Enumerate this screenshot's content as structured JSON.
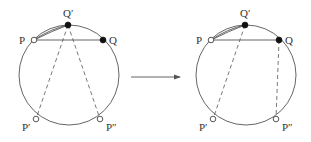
{
  "diagram": {
    "left": {
      "labels": {
        "P": "P",
        "Q_prime": "Q′",
        "Q": "Q",
        "P_prime": "P′",
        "P_double_prime": "P″"
      },
      "points": [
        {
          "name": "P",
          "style": "open"
        },
        {
          "name": "Q′",
          "style": "filled"
        },
        {
          "name": "Q",
          "style": "filled"
        },
        {
          "name": "P′",
          "style": "open"
        },
        {
          "name": "P″",
          "style": "open"
        }
      ],
      "solid_segments": [
        [
          "P",
          "Q"
        ],
        [
          "P",
          "Q′"
        ]
      ],
      "dashed_segments": [
        [
          "Q′",
          "P′"
        ],
        [
          "Q′",
          "P″"
        ]
      ]
    },
    "right": {
      "labels": {
        "P": "P",
        "Q_prime": "Q′",
        "Q": "Q",
        "P_prime": "P′",
        "P_double_prime": "P″"
      },
      "points": [
        {
          "name": "P",
          "style": "open"
        },
        {
          "name": "Q′",
          "style": "filled"
        },
        {
          "name": "Q",
          "style": "filled"
        },
        {
          "name": "P′",
          "style": "open"
        },
        {
          "name": "P″",
          "style": "open"
        }
      ],
      "solid_segments": [
        [
          "P",
          "Q"
        ],
        [
          "P",
          "Q′"
        ]
      ],
      "dashed_segments": [
        [
          "Q′",
          "P′"
        ],
        [
          "Q",
          "P″"
        ]
      ]
    },
    "arrow": {
      "direction": "right",
      "meaning": "transforms to"
    },
    "colors": {
      "line": "#555555",
      "filled_point": "#111111",
      "open_point_fill": "#ffffff"
    }
  }
}
